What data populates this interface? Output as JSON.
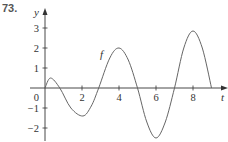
{
  "problem_number": "73.",
  "colors": {
    "axis": "#333333",
    "curve": "#666666",
    "label": "#333333"
  },
  "chart_data": {
    "type": "line",
    "title": "",
    "xlabel": "t",
    "ylabel": "y",
    "curve_label": "f",
    "x_ticks": [
      2,
      4,
      6,
      8
    ],
    "x_tick_labels": [
      "2",
      "4",
      "6",
      "8"
    ],
    "y_ticks": [
      -2,
      -1,
      1,
      2,
      3
    ],
    "y_tick_labels": [
      "−2",
      "−1",
      "1",
      "2",
      "3"
    ],
    "origin_label": "0",
    "xlim": [
      0,
      9.8
    ],
    "ylim": [
      -2.6,
      3.9
    ],
    "grid": false,
    "series": [
      {
        "name": "f",
        "x": [
          0,
          0.3,
          0.8,
          1.4,
          2.05,
          2.5,
          2.9,
          3.5,
          4.0,
          4.5,
          5.0,
          5.5,
          6.0,
          6.5,
          7.0,
          7.5,
          8.0,
          8.5,
          9.0
        ],
        "values": [
          0,
          0.5,
          0.0,
          -1.0,
          -1.4,
          -0.9,
          0.0,
          1.5,
          2.0,
          1.4,
          0.0,
          -1.7,
          -2.5,
          -1.7,
          0.0,
          2.0,
          2.85,
          2.0,
          0.0
        ]
      }
    ]
  }
}
